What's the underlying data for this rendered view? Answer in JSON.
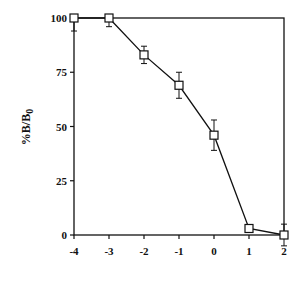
{
  "chart_data": {
    "type": "line",
    "title": "",
    "xlabel": "",
    "ylabel": "%B/B0",
    "ylabel_main": "%B/B",
    "ylabel_subscript": "0",
    "x": [
      -4,
      -3,
      -2,
      -1,
      0,
      1,
      2
    ],
    "series": [
      {
        "name": "%B/B0",
        "marker": "open-square",
        "values": [
          100,
          100,
          83,
          69,
          46,
          3,
          0
        ],
        "error": [
          6,
          4,
          4,
          6,
          7,
          0,
          5
        ]
      }
    ],
    "xlim": [
      -4,
      2
    ],
    "ylim": [
      0,
      100
    ],
    "xticks": [
      "-4",
      "-3",
      "-2",
      "-1",
      "0",
      "1",
      "2"
    ],
    "yticks": [
      "0",
      "25",
      "50",
      "75",
      "100"
    ],
    "grid": false,
    "legend": "none",
    "frame": "box"
  },
  "colors": {
    "line": "#111111",
    "background": "#ffffff"
  }
}
